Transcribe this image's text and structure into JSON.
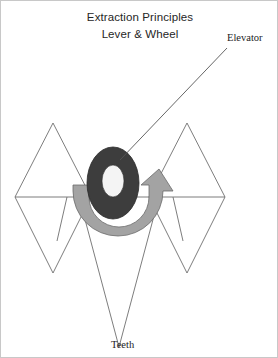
{
  "figure": {
    "title_lines": [
      "Extraction Principles",
      "Lever & Wheel"
    ],
    "labels": {
      "elevator": "Elevator",
      "teeth": "Teeth"
    },
    "colors": {
      "background": "#ffffff",
      "outline": "#6e6e6e",
      "elevator_ring": "#3d3d3d",
      "elevator_hole": "#f2f2f2",
      "wheel_arrow": "#a3a3a3",
      "wheel_arrow_stroke": "#6b6b6b",
      "text": "#262626",
      "leader_line": "#555555"
    },
    "elements": {
      "upper_triangles": 2,
      "lower_triangles": 3,
      "horizontal_line": 1,
      "elevator_ring": "dark-ellipse-ring",
      "rotation_arrow": "gray-curved-arrow-clockwise"
    }
  }
}
